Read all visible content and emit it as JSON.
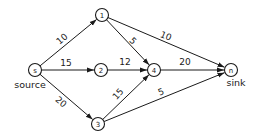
{
  "diagram": {
    "type": "flow-network",
    "nodes": [
      {
        "id": "s",
        "label": "s",
        "x": 35,
        "y": 70,
        "caption": "source"
      },
      {
        "id": "1",
        "label": "1",
        "x": 102,
        "y": 15
      },
      {
        "id": "2",
        "label": "2",
        "x": 101,
        "y": 70
      },
      {
        "id": "3",
        "label": "3",
        "x": 98,
        "y": 124
      },
      {
        "id": "4",
        "label": "4",
        "x": 154,
        "y": 70
      },
      {
        "id": "n",
        "label": "n",
        "x": 231,
        "y": 70,
        "caption": "sink"
      }
    ],
    "edges": [
      {
        "from": "s",
        "to": "1",
        "capacity": "10",
        "lx": 62,
        "ly": 39,
        "rot": -40
      },
      {
        "from": "s",
        "to": "2",
        "capacity": "15",
        "lx": 66,
        "ly": 63,
        "rot": 0
      },
      {
        "from": "s",
        "to": "3",
        "capacity": "20",
        "lx": 61,
        "ly": 102,
        "rot": 40
      },
      {
        "from": "1",
        "to": "4",
        "capacity": "5",
        "lx": 133,
        "ly": 41,
        "rot": 45
      },
      {
        "from": "1",
        "to": "n",
        "capacity": "10",
        "lx": 166,
        "ly": 36,
        "rot": 22
      },
      {
        "from": "2",
        "to": "4",
        "capacity": "12",
        "lx": 125,
        "ly": 62,
        "rot": 0
      },
      {
        "from": "3",
        "to": "4",
        "capacity": "15",
        "lx": 118,
        "ly": 94,
        "rot": -48
      },
      {
        "from": "3",
        "to": "n",
        "capacity": "5",
        "lx": 161,
        "ly": 92,
        "rot": -22
      },
      {
        "from": "4",
        "to": "n",
        "capacity": "20",
        "lx": 185,
        "ly": 62,
        "rot": 0
      }
    ],
    "captions": {
      "source": "source",
      "sink": "sink"
    }
  }
}
